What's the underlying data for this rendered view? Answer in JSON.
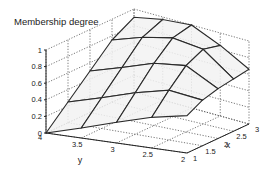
{
  "chart_data": {
    "type": "surface",
    "title": "Membership degree",
    "xlabel": "x",
    "ylabel": "y",
    "zlabel": "Membership degree",
    "x": [
      1,
      1.5,
      2,
      2.5,
      3
    ],
    "y": [
      4,
      3.5,
      3,
      2.5,
      2
    ],
    "z": [
      [
        0.0,
        0.12,
        0.25,
        0.37,
        0.45
      ],
      [
        0.25,
        0.37,
        0.5,
        0.6,
        0.55
      ],
      [
        0.5,
        0.62,
        0.75,
        0.8,
        0.6
      ],
      [
        0.75,
        0.87,
        0.95,
        0.9,
        0.63
      ],
      [
        0.9,
        0.97,
        1.0,
        0.85,
        0.66
      ]
    ],
    "xlim": [
      1,
      3
    ],
    "ylim": [
      2,
      4
    ],
    "zlim": [
      0,
      1
    ],
    "x_ticks": [
      "1",
      "1.5",
      "2",
      "2.5",
      "3"
    ],
    "y_ticks": [
      "4",
      "3.5",
      "3",
      "2.5",
      "2"
    ],
    "z_ticks": [
      "0",
      "0.2",
      "0.4",
      "0.6",
      "0.8",
      "1"
    ],
    "grid": true
  }
}
